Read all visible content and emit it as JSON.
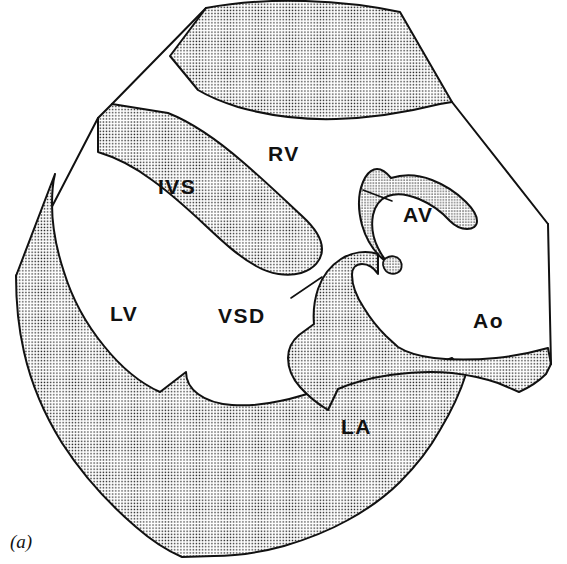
{
  "figure": {
    "kind": "anatomical-line-drawing",
    "caption": "(a)",
    "background_color": "#ffffff",
    "ink_color": "#111111",
    "stipple_dot_color": "#1a1a1a",
    "stipple_background_color": "#ffffff",
    "stroke_width": 2
  },
  "labels": [
    {
      "id": "rv",
      "text": "RV",
      "meaning": "right ventricle",
      "x": 268,
      "y": 143,
      "has_leader": false
    },
    {
      "id": "ivs",
      "text": "IVS",
      "meaning": "interventricular septum",
      "x": 158,
      "y": 176,
      "has_leader": false
    },
    {
      "id": "av",
      "text": "AV",
      "meaning": "aortic valve",
      "x": 403,
      "y": 204,
      "has_leader": true
    },
    {
      "id": "lv",
      "text": "LV",
      "meaning": "left ventricle",
      "x": 110,
      "y": 303,
      "has_leader": false
    },
    {
      "id": "vsd",
      "text": "VSD",
      "meaning": "ventricular septal defect",
      "x": 218,
      "y": 305,
      "has_leader": true
    },
    {
      "id": "ao",
      "text": "Ao",
      "meaning": "aorta",
      "x": 473,
      "y": 310,
      "has_leader": false
    },
    {
      "id": "la",
      "text": "LA",
      "meaning": "left atrium",
      "x": 341,
      "y": 416,
      "has_leader": false
    }
  ],
  "leader_lines": [
    {
      "id": "av-leader",
      "for_label": "AV",
      "x1": 392,
      "y1": 201,
      "x2": 363,
      "y2": 190
    },
    {
      "id": "vsd-leader",
      "for_label": "VSD",
      "x1": 291,
      "y1": 298,
      "x2": 322,
      "y2": 277
    }
  ],
  "regions": [
    {
      "id": "rv-anterior-wall",
      "name": "right ventricular anterior wall",
      "fill": "stipple"
    },
    {
      "id": "interventricular-septum",
      "name": "interventricular septum",
      "fill": "stipple"
    },
    {
      "id": "lv-posterior-wall",
      "name": "left ventricular posterior wall",
      "fill": "stipple"
    },
    {
      "id": "anterior-mitral-leaflet",
      "name": "anterior mitral leaflet",
      "fill": "stipple"
    },
    {
      "id": "aortic-valve-cusp",
      "name": "aortic valve cusp",
      "fill": "stipple"
    },
    {
      "id": "valve-coaptation-nodule",
      "name": "valve coaptation nodule",
      "fill": "stipple"
    },
    {
      "id": "right-ventricle-cavity",
      "name": "right ventricle cavity",
      "fill": "white"
    },
    {
      "id": "left-ventricle-cavity",
      "name": "left ventricle cavity",
      "fill": "white"
    },
    {
      "id": "aorta-lumen",
      "name": "aorta lumen",
      "fill": "white"
    },
    {
      "id": "left-atrium-cavity",
      "name": "left atrium cavity",
      "fill": "white"
    }
  ]
}
